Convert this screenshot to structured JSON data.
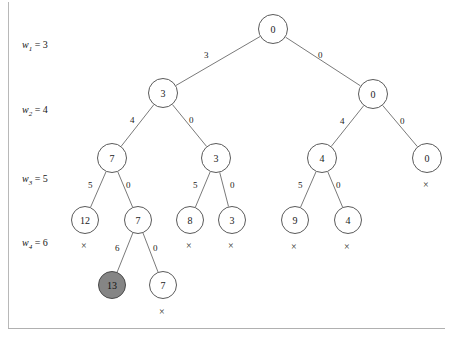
{
  "figure": {
    "background_color": "#ffffff",
    "frame_color": "#b8b8b8",
    "node_stroke_color": "#5a5a5a",
    "edge_stroke_color": "#7a7a7a",
    "shaded_node_fill": "#858585"
  },
  "level_labels": [
    {
      "name": "w",
      "subscript": "1",
      "equals": "=",
      "value": "3",
      "text": "w1 = 3",
      "x": 22,
      "y": 45
    },
    {
      "name": "w",
      "subscript": "2",
      "equals": "=",
      "value": "4",
      "text": "w2 = 4",
      "x": 22,
      "y": 110
    },
    {
      "name": "w",
      "subscript": "3",
      "equals": "=",
      "value": "5",
      "text": "w3 = 5",
      "x": 22,
      "y": 179
    },
    {
      "name": "w",
      "subscript": "4",
      "equals": "=",
      "value": "6",
      "text": "w4 = 6",
      "x": 22,
      "y": 243
    }
  ],
  "nodes": [
    {
      "id": "n0",
      "label": "0",
      "x": 273,
      "y": 29,
      "r": 15,
      "shaded": false
    },
    {
      "id": "n1",
      "label": "3",
      "x": 163,
      "y": 93,
      "r": 15,
      "shaded": false
    },
    {
      "id": "n2",
      "label": "0",
      "x": 373,
      "y": 94,
      "r": 15,
      "shaded": false
    },
    {
      "id": "n3",
      "label": "7",
      "x": 112,
      "y": 158,
      "r": 15,
      "shaded": false
    },
    {
      "id": "n4",
      "label": "3",
      "x": 216,
      "y": 158,
      "r": 15,
      "shaded": false
    },
    {
      "id": "n5",
      "label": "4",
      "x": 322,
      "y": 158,
      "r": 15,
      "shaded": false
    },
    {
      "id": "n6",
      "label": "0",
      "x": 427,
      "y": 158,
      "r": 15,
      "shaded": false
    },
    {
      "id": "n7",
      "label": "12",
      "x": 85,
      "y": 220,
      "r": 14,
      "shaded": false
    },
    {
      "id": "n8",
      "label": "7",
      "x": 138,
      "y": 220,
      "r": 14,
      "shaded": false
    },
    {
      "id": "n9",
      "label": "8",
      "x": 190,
      "y": 220,
      "r": 14,
      "shaded": false
    },
    {
      "id": "n10",
      "label": "3",
      "x": 232,
      "y": 220,
      "r": 14,
      "shaded": false
    },
    {
      "id": "n11",
      "label": "9",
      "x": 295,
      "y": 220,
      "r": 14,
      "shaded": false
    },
    {
      "id": "n12",
      "label": "4",
      "x": 348,
      "y": 220,
      "r": 14,
      "shaded": false
    },
    {
      "id": "n13",
      "label": "13",
      "x": 112,
      "y": 285,
      "r": 14,
      "shaded": true
    },
    {
      "id": "n14",
      "label": "7",
      "x": 163,
      "y": 285,
      "r": 14,
      "shaded": false
    }
  ],
  "edges": [
    {
      "from": "n0",
      "to": "n1",
      "weight": "3",
      "label_x": 208,
      "label_y": 56
    },
    {
      "from": "n0",
      "to": "n2",
      "weight": "0",
      "label_x": 322,
      "label_y": 56
    },
    {
      "from": "n1",
      "to": "n3",
      "weight": "4",
      "label_x": 134,
      "label_y": 121
    },
    {
      "from": "n1",
      "to": "n4",
      "weight": "0",
      "label_x": 193,
      "label_y": 121
    },
    {
      "from": "n2",
      "to": "n5",
      "weight": "4",
      "label_x": 344,
      "label_y": 122
    },
    {
      "from": "n2",
      "to": "n6",
      "weight": "0",
      "label_x": 404,
      "label_y": 122
    },
    {
      "from": "n3",
      "to": "n7",
      "weight": "5",
      "label_x": 92,
      "label_y": 186
    },
    {
      "from": "n3",
      "to": "n8",
      "weight": "0",
      "label_x": 130,
      "label_y": 186
    },
    {
      "from": "n4",
      "to": "n9",
      "weight": "5",
      "label_x": 197,
      "label_y": 186
    },
    {
      "from": "n4",
      "to": "n10",
      "weight": "0",
      "label_x": 234,
      "label_y": 186
    },
    {
      "from": "n5",
      "to": "n11",
      "weight": "5",
      "label_x": 302,
      "label_y": 186
    },
    {
      "from": "n5",
      "to": "n12",
      "weight": "0",
      "label_x": 340,
      "label_y": 186
    },
    {
      "from": "n8",
      "to": "n13",
      "weight": "6",
      "label_x": 119,
      "label_y": 249
    },
    {
      "from": "n8",
      "to": "n14",
      "weight": "0",
      "label_x": 157,
      "label_y": 249
    }
  ],
  "cross_marks": [
    {
      "symbol": "×",
      "for_node": "n6",
      "x": 427,
      "y": 185
    },
    {
      "symbol": "×",
      "for_node": "n7",
      "x": 85,
      "y": 246
    },
    {
      "symbol": "×",
      "for_node": "n9",
      "x": 190,
      "y": 246
    },
    {
      "symbol": "×",
      "for_node": "n10",
      "x": 232,
      "y": 246
    },
    {
      "symbol": "×",
      "for_node": "n11",
      "x": 295,
      "y": 247
    },
    {
      "symbol": "×",
      "for_node": "n12",
      "x": 348,
      "y": 247
    },
    {
      "symbol": "×",
      "for_node": "n14",
      "x": 163,
      "y": 312
    }
  ]
}
